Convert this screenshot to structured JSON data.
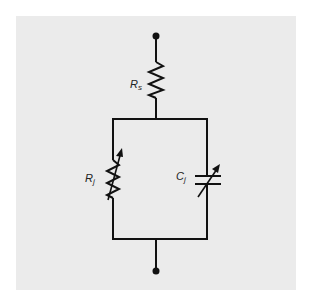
{
  "diagram": {
    "type": "circuit",
    "colors": {
      "panel_bg": "#ebebeb",
      "page_bg": "#ffffff",
      "stroke": "#111111"
    },
    "components": {
      "series_resistor": {
        "symbol": "R",
        "subscript": "s"
      },
      "junction_resistor": {
        "symbol": "R",
        "subscript": "j",
        "variable": true
      },
      "junction_capacitor": {
        "symbol": "C",
        "subscript": "j",
        "variable": true
      }
    },
    "terminals": [
      "top-terminal",
      "bottom-terminal"
    ]
  }
}
